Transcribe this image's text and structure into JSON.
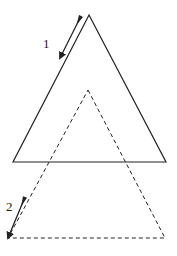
{
  "figure": {
    "width": 177,
    "height": 256,
    "background": "#ffffff",
    "stroke_color": "#222222"
  },
  "solid_triangle": {
    "style": "solid",
    "apex": [
      89,
      15
    ],
    "base_left": [
      13,
      162
    ],
    "base_right": [
      166,
      162
    ]
  },
  "dashed_triangle": {
    "style": "dashed",
    "apex": [
      88,
      90
    ],
    "base_left": [
      8,
      238
    ],
    "base_right": [
      165,
      238
    ]
  },
  "arrows": [
    {
      "id": "arrow-1",
      "label": "1",
      "from": [
        81,
        16
      ],
      "to": [
        60,
        58
      ],
      "label_pos": [
        43,
        48
      ]
    },
    {
      "id": "arrow-2",
      "label": "2",
      "from": [
        25,
        197
      ],
      "to": [
        8,
        238
      ],
      "label_pos": [
        6,
        211
      ]
    }
  ]
}
